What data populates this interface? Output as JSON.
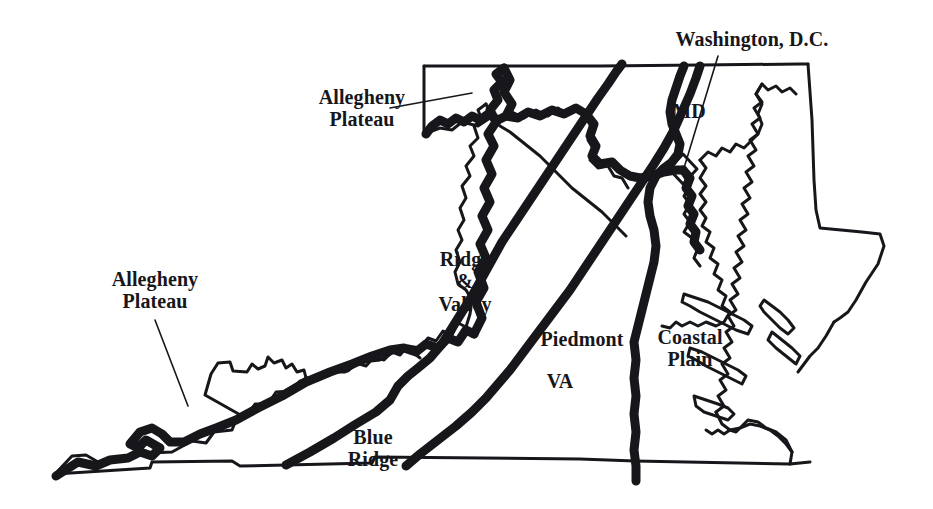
{
  "figure": {
    "kind": "physiographic-province-map",
    "region": "Virginia and Maryland",
    "background_color": "#ffffff",
    "ink_color": "#17161a"
  },
  "labels": {
    "allegheny_plateau_north": "Allegheny\nPlateau",
    "allegheny_plateau_west": "Allegheny\nPlateau",
    "ridge_and_valley": "Ridge\n&\nValley",
    "blue_ridge": "Blue\nRidge",
    "piedmont": "Piedmont",
    "coastal_plain": "Coastal\nPlain",
    "washington_dc": "Washington, D.C.",
    "state_va": "VA",
    "state_md": "MD"
  },
  "features": [
    {
      "name": "allegheny-plateau-north-leader",
      "type": "leader-line"
    },
    {
      "name": "allegheny-plateau-west-leader",
      "type": "leader-line"
    },
    {
      "name": "washington-dc-leader",
      "type": "leader-line"
    },
    {
      "name": "washington-dc-marker",
      "type": "diamond-marker"
    },
    {
      "name": "blue-ridge-west-boundary",
      "type": "bold-province-boundary"
    },
    {
      "name": "blue-ridge-east-boundary",
      "type": "bold-province-boundary"
    },
    {
      "name": "fall-line",
      "type": "bold-province-boundary"
    },
    {
      "name": "allegheny-front",
      "type": "bold-province-boundary"
    },
    {
      "name": "potomac-river",
      "type": "bold-river-border"
    },
    {
      "name": "chesapeake-bay",
      "type": "coastline"
    },
    {
      "name": "state-outline",
      "type": "thin-border"
    }
  ]
}
